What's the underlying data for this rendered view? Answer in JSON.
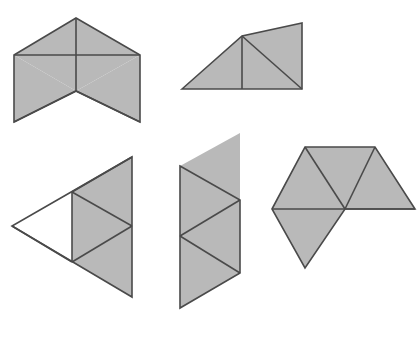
{
  "figure": {
    "title": "",
    "background_color": "#ffffff",
    "width": 420,
    "height": 343,
    "fill_color": "#b9b9b9",
    "stroke_color": "#4a4a4a",
    "stroke_width": 1.6,
    "shapes": [
      {
        "id": "shape-1",
        "name": "bowtie-net-top-left",
        "label": "Shape 1",
        "triangle_count": 4,
        "faces": [
          {
            "name": "face-left-upper",
            "points": "14,55 76,18 76,91"
          },
          {
            "name": "face-mid-upper",
            "points": "76,18 140,55 76,91"
          },
          {
            "name": "face-left-lower",
            "points": "14,55 76,91 14,122"
          },
          {
            "name": "face-right-lower",
            "points": "76,91 140,55 140,122"
          }
        ],
        "outline": "14,55 76,18 140,55 140,122 76,91 14,122",
        "creases": [
          "14,55 140,55",
          "76,18 76,91",
          "14,122 76,91",
          "76,91 140,122"
        ]
      },
      {
        "id": "shape-2",
        "name": "parallelogram-net-top-right",
        "label": "Shape 2",
        "triangle_count": 3,
        "faces": [
          {
            "name": "face-left",
            "points": "182,89 242,36 242,89"
          },
          {
            "name": "face-upper-right",
            "points": "242,36 302,23 302,89"
          },
          {
            "name": "face-lower-right",
            "points": "242,36 302,89 242,89"
          }
        ],
        "outline": "182,89 242,36 302,23 302,89",
        "creases": [
          "242,36 242,89",
          "242,36 302,89"
        ]
      },
      {
        "id": "shape-3",
        "name": "triangle-net-bottom-left",
        "label": "Shape 3",
        "triangle_count": 4,
        "faces": [
          {
            "name": "face-upper",
            "points": "12,226 132,157 72,192"
          },
          {
            "name": "face-top-right",
            "points": "72,192 132,157 132,226"
          },
          {
            "name": "face-middle",
            "points": "72,192 132,226 72,262"
          },
          {
            "name": "face-bottom-right",
            "points": "72,262 132,226 132,297"
          }
        ],
        "outline": "132,157 132,297 12,226",
        "creases": [
          "72,192 132,157",
          "72,192 72,262",
          "72,192 132,226",
          "72,262 132,226",
          "12,226 72,262"
        ]
      },
      {
        "id": "shape-4",
        "name": "zigzag-strip-net-bottom-middle",
        "label": "Shape 4",
        "triangle_count": 4,
        "faces": [
          {
            "name": "face-1",
            "points": "180,166 240,200 180,236"
          },
          {
            "name": "face-2",
            "points": "180,236 240,200 240,273"
          },
          {
            "name": "face-3",
            "points": "180,236 240,273 180,308"
          },
          {
            "name": "face-4",
            "points": "180,166 240,200 240,133"
          }
        ],
        "outline": "180,166 240,200 240,273 180,308",
        "creases": [
          "180,236 240,200",
          "180,236 240,273"
        ]
      },
      {
        "id": "shape-5",
        "name": "fan-net-bottom-right",
        "label": "Shape 5",
        "triangle_count": 4,
        "faces": [
          {
            "name": "face-left-upper",
            "points": "272,209 305,147 345,209"
          },
          {
            "name": "face-mid-upper",
            "points": "305,147 375,147 345,209"
          },
          {
            "name": "face-right-upper",
            "points": "375,147 415,209 345,209"
          },
          {
            "name": "face-bottom",
            "points": "272,209 345,209 305,268"
          }
        ],
        "outline": "272,209 305,147 375,147 415,209 345,209 305,268",
        "creases": [
          "272,209 345,209",
          "305,147 345,209",
          "375,147 345,209",
          "345,209 415,209"
        ]
      }
    ]
  }
}
